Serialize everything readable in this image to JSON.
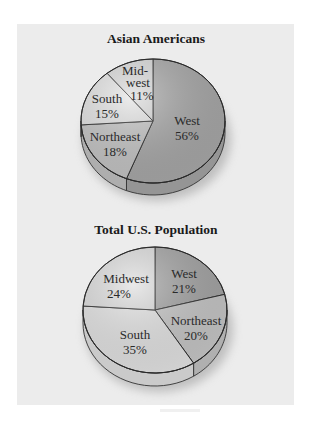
{
  "chart_data": [
    {
      "type": "pie",
      "title": "Asian Americans",
      "categories": [
        "West",
        "Northeast",
        "South",
        "Midwest"
      ],
      "labels": [
        "West",
        "Northeast",
        "South",
        "Mid-west"
      ],
      "values": [
        56,
        18,
        15,
        11
      ],
      "unit": "%",
      "colors": [
        "#a9a9a9",
        "#c6c6c6",
        "#e4e4e4",
        "#dadada"
      ],
      "geometry": {
        "cx": 153,
        "cy": 121,
        "rx": 72,
        "ry": 62,
        "depth": 12,
        "start_angle_deg": 0,
        "direction": "clockwise"
      }
    },
    {
      "type": "pie",
      "title": "Total U.S. Population",
      "categories": [
        "West",
        "Northeast",
        "South",
        "Midwest"
      ],
      "labels": [
        "West",
        "Northeast",
        "South",
        "Midwest"
      ],
      "values": [
        21,
        20,
        35,
        24
      ],
      "unit": "%",
      "colors": [
        "#a5a5a5",
        "#c8c8c8",
        "#e6e6e6",
        "#dedede"
      ],
      "geometry": {
        "cx": 155,
        "cy": 310,
        "rx": 72,
        "ry": 63,
        "depth": 13,
        "start_angle_deg": 0,
        "direction": "clockwise"
      }
    }
  ],
  "charts": {
    "top": {
      "title": "Asian Americans",
      "slices": [
        {
          "name": "West",
          "line1": "West",
          "line2": "56%"
        },
        {
          "name": "Northeast",
          "line1": "Northeast",
          "line2": "18%"
        },
        {
          "name": "South",
          "line1": "South",
          "line2": "15%"
        },
        {
          "name": "Midwest",
          "line0": "Mid-",
          "line1": "west",
          "line2": "11%"
        }
      ]
    },
    "bottom": {
      "title": "Total U.S. Population",
      "slices": [
        {
          "name": "West",
          "line1": "West",
          "line2": "21%"
        },
        {
          "name": "Northeast",
          "line1": "Northeast",
          "line2": "20%"
        },
        {
          "name": "South",
          "line1": "South",
          "line2": "35%"
        },
        {
          "name": "Midwest",
          "line1": "Midwest",
          "line2": "24%"
        }
      ]
    }
  }
}
